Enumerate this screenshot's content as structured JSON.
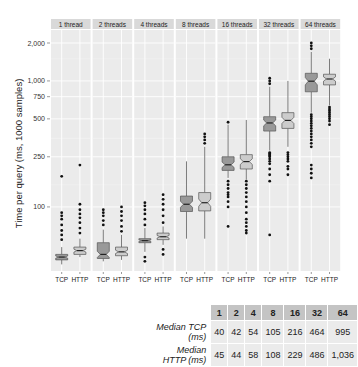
{
  "chart_data": {
    "type": "boxplot",
    "title": "",
    "ylabel": "Time per query (ms, 1000 samples)",
    "xlabel": "",
    "yscale": "log",
    "ylim": [
      31,
      2600
    ],
    "y_ticks": [
      100,
      250,
      500,
      750,
      1000,
      2000
    ],
    "y_tick_labels": [
      "100",
      "250",
      "500",
      "750",
      "1,000",
      "2,000"
    ],
    "grid": true,
    "facets": [
      "1 thread",
      "2 threads",
      "4 threads",
      "8 threads",
      "16 threads",
      "32 threads",
      "64 threads"
    ],
    "categories": [
      "TCP",
      "HTTP"
    ],
    "colors": {
      "TCP": "#999999",
      "HTTP": "#cccccc",
      "panel_bg": "#ebebeb",
      "strip_bg": "#d9d9d9",
      "grid": "#ffffff"
    },
    "series": [
      {
        "facet": "1 thread",
        "TCP": {
          "low": 35,
          "q1": 38,
          "median": 40,
          "q3": 42,
          "high": 48,
          "outliers": [
            55,
            60,
            65,
            72,
            80,
            85,
            90,
            175
          ]
        },
        "HTTP": {
          "low": 40,
          "q1": 42,
          "median": 45,
          "q3": 48,
          "high": 56,
          "outliers": [
            62,
            68,
            75,
            82,
            88,
            95,
            105,
            215
          ]
        }
      },
      {
        "facet": "2 threads",
        "TCP": {
          "low": 37,
          "q1": 39,
          "median": 42,
          "q3": 52,
          "high": 66,
          "outliers": [
            72,
            78,
            85,
            90,
            95
          ]
        },
        "HTTP": {
          "low": 38,
          "q1": 41,
          "median": 44,
          "q3": 48,
          "high": 60,
          "outliers": [
            64,
            70,
            78,
            85,
            92,
            100
          ]
        }
      },
      {
        "facet": "4 threads",
        "TCP": {
          "low": 44,
          "q1": 52,
          "median": 54,
          "q3": 56,
          "high": 68,
          "outliers": [
            37,
            40,
            72,
            80,
            88,
            95,
            102,
            108
          ]
        },
        "HTTP": {
          "low": 50,
          "q1": 55,
          "median": 58,
          "q3": 62,
          "high": 70,
          "outliers": [
            42,
            46,
            75,
            85,
            95,
            105,
            115,
            125
          ]
        }
      },
      {
        "facet": "8 threads",
        "TCP": {
          "low": 56,
          "q1": 92,
          "median": 105,
          "q3": 122,
          "high": 230,
          "outliers": []
        },
        "HTTP": {
          "low": 56,
          "q1": 93,
          "median": 108,
          "q3": 130,
          "high": 300,
          "outliers": [
            320,
            340,
            360,
            380
          ]
        }
      },
      {
        "facet": "16 threads",
        "TCP": {
          "low": 170,
          "q1": 195,
          "median": 216,
          "q3": 250,
          "high": 450,
          "outliers": [
            70,
            100,
            110,
            120,
            125,
            130,
            140,
            150,
            160,
            470
          ]
        },
        "HTTP": {
          "low": 165,
          "q1": 200,
          "median": 229,
          "q3": 260,
          "high": 490,
          "outliers": [
            62,
            65,
            70,
            75,
            80,
            90,
            100,
            110,
            120,
            130,
            140,
            150,
            160
          ]
        }
      },
      {
        "facet": "32 threads",
        "TCP": {
          "low": 280,
          "q1": 400,
          "median": 464,
          "q3": 520,
          "high": 900,
          "outliers": [
            60,
            160,
            180,
            200,
            220,
            230,
            240,
            250,
            255,
            260,
            265,
            270,
            950,
            1000,
            1050
          ]
        },
        "HTTP": {
          "low": 300,
          "q1": 420,
          "median": 486,
          "q3": 560,
          "high": 1000,
          "outliers": [
            180,
            200,
            210,
            230,
            240,
            250,
            260,
            270
          ]
        }
      },
      {
        "facet": "64 threads",
        "TCP": {
          "low": 560,
          "q1": 820,
          "median": 995,
          "q3": 1150,
          "high": 1700,
          "outliers": [
            170,
            185,
            200,
            215,
            300,
            320,
            340,
            360,
            380,
            400,
            420,
            440,
            460,
            480,
            500,
            520,
            540,
            1800,
            1900,
            2000
          ]
        },
        "HTTP": {
          "low": 640,
          "q1": 930,
          "median": 1036,
          "q3": 1130,
          "high": 1500,
          "outliers": [
            450,
            480,
            500,
            520,
            540,
            560,
            580,
            600,
            620
          ]
        }
      }
    ],
    "table": {
      "columns": [
        "1",
        "2",
        "4",
        "8",
        "16",
        "32",
        "64"
      ],
      "rows": [
        {
          "label": "Median TCP (ms)",
          "values": [
            "40",
            "42",
            "54",
            "105",
            "216",
            "464",
            "995"
          ]
        },
        {
          "label": "Median HTTP (ms)",
          "values": [
            "45",
            "44",
            "58",
            "108",
            "229",
            "486",
            "1,036"
          ]
        }
      ]
    }
  },
  "table": {
    "columns": [
      "1",
      "2",
      "4",
      "8",
      "16",
      "32",
      "64"
    ],
    "row_tcp_label": "Median TCP (ms)",
    "row_http_label": "Median HTTP (ms)",
    "tcp": [
      "40",
      "42",
      "54",
      "105",
      "216",
      "464",
      "995"
    ],
    "http": [
      "45",
      "44",
      "58",
      "108",
      "229",
      "486",
      "1,036"
    ]
  }
}
